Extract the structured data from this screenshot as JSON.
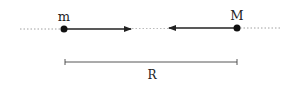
{
  "diagram": {
    "type": "two-body gravitational attraction",
    "bodies": [
      {
        "label": "m",
        "x": 64,
        "y": 29
      },
      {
        "label": "M",
        "x": 237,
        "y": 28
      }
    ],
    "forces": [
      {
        "from": "m",
        "direction": "toward M",
        "tip_x": 131
      },
      {
        "from": "M",
        "direction": "toward m",
        "tip_x": 169
      }
    ],
    "distance": {
      "label": "R",
      "x1": 65,
      "x2": 237,
      "y": 62
    }
  }
}
